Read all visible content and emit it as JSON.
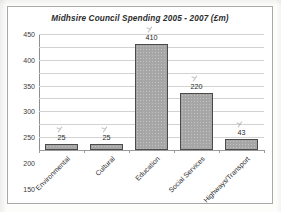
{
  "chart_data": {
    "type": "bar",
    "title": "Midhsire Council Spending  2005 - 2007  (£m)",
    "xlabel": "",
    "ylabel": "",
    "categories": [
      "Environmental",
      "Cultural",
      "Education",
      "Social Services",
      "Highways/Transport"
    ],
    "values": [
      25,
      25,
      410,
      220,
      43
    ],
    "data_labels": [
      "25",
      "25",
      "410",
      "220",
      "43"
    ],
    "ylim": [
      0,
      450
    ],
    "ytick_step": 50,
    "yticks": [
      450,
      400,
      350,
      300,
      250,
      200,
      150,
      100,
      50,
      0
    ],
    "ytick_labels": [
      "450",
      "400",
      "350",
      "300",
      "250",
      "200",
      "150",
      "100",
      "50",
      "0"
    ],
    "grid": true,
    "legend": false,
    "legend_position": "none",
    "series": [
      {
        "name": "Spending",
        "values": [
          25,
          25,
          410,
          220,
          43
        ]
      }
    ],
    "annotations": [
      "pencil tick above 25 (Environmental)",
      "pencil tick above 25 (Cultural)",
      "pencil tick above 410 (Education)",
      "pencil tick above 220 (Social Services)",
      "pencil tick above 43 (Highways/Transport)"
    ]
  },
  "colors": {
    "bar_fill": "#a6a6a6",
    "bar_border": "#4a4a4a",
    "gridline": "#d2d2d2",
    "axis": "#8f8f8f",
    "frame": "#a9a9a9",
    "text": "#2d2d2d",
    "background": "#ffffff",
    "pencil": "#8d8d8d"
  }
}
